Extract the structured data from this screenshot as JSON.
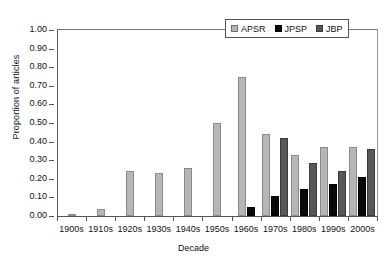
{
  "chart_data": {
    "type": "bar",
    "title": "",
    "xlabel": "Decade",
    "ylabel": "Proportion of articles",
    "ylim": [
      0.0,
      1.0
    ],
    "ytick_labels": [
      "0.00",
      "0.10",
      "0.20",
      "0.30",
      "0.40",
      "0.50",
      "0.60",
      "0.70",
      "0.80",
      "0.90",
      "1.00"
    ],
    "ytick_values": [
      0.0,
      0.1,
      0.2,
      0.3,
      0.4,
      0.5,
      0.6,
      0.7,
      0.8,
      0.9,
      1.0
    ],
    "grid": false,
    "legend_position": "top-right",
    "categories": [
      "1900s",
      "1910s",
      "1920s",
      "1930s",
      "1940s",
      "1950s",
      "1960s",
      "1970s",
      "1980s",
      "1990s",
      "2000s"
    ],
    "series": [
      {
        "name": "APSR",
        "color": "#b6b6b6",
        "values": [
          0.01,
          0.04,
          0.24,
          0.23,
          0.26,
          0.5,
          0.75,
          0.44,
          0.33,
          0.37,
          0.37
        ]
      },
      {
        "name": "JPSP",
        "color": "#0a0a0a",
        "values": [
          null,
          null,
          null,
          null,
          null,
          null,
          0.05,
          0.11,
          0.145,
          0.17,
          0.21
        ]
      },
      {
        "name": "JBP",
        "color": "#585858",
        "values": [
          null,
          null,
          null,
          null,
          null,
          null,
          null,
          0.42,
          0.285,
          0.24,
          0.36
        ]
      }
    ]
  },
  "legend": {
    "items": [
      {
        "label": "APSR"
      },
      {
        "label": "JPSP"
      },
      {
        "label": "JBP"
      }
    ]
  }
}
